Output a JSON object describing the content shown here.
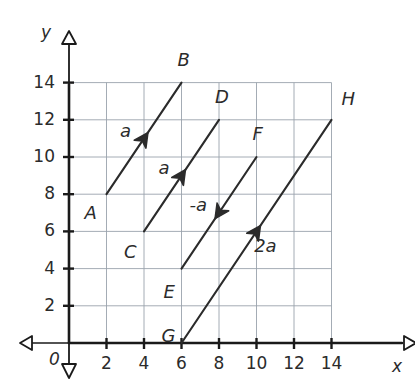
{
  "figure": {
    "axes": {
      "x": {
        "name": "x",
        "ticks": [
          2,
          4,
          6,
          8,
          10,
          12,
          14
        ],
        "min": 0,
        "max": 14,
        "origin_label": "0"
      },
      "y": {
        "name": "y",
        "ticks": [
          2,
          4,
          6,
          8,
          10,
          12,
          14
        ],
        "min": 0,
        "max": 14
      }
    },
    "colors": {
      "ink": "#2b2b2b",
      "grid": "#9aa3ad",
      "axis": "#1a1a1a",
      "vector": "#2b2b2b"
    }
  },
  "chart_data": {
    "type": "scatter",
    "title": "",
    "xlabel": "x",
    "ylabel": "y",
    "xlim": [
      0,
      14
    ],
    "ylim": [
      0,
      14
    ],
    "xticks": [
      2,
      4,
      6,
      8,
      10,
      12,
      14
    ],
    "yticks": [
      2,
      4,
      6,
      8,
      10,
      12,
      14
    ],
    "grid": true,
    "legend": "none",
    "vectors": [
      {
        "id": "AB",
        "tail_label": "A",
        "head_label": "B",
        "tail": [
          2,
          8
        ],
        "head": [
          6,
          14
        ],
        "components": [
          4,
          6
        ],
        "magnitude_label": "a",
        "label_pos": [
          3.2,
          11.4
        ]
      },
      {
        "id": "CD",
        "tail_label": "C",
        "head_label": "D",
        "tail": [
          4,
          6
        ],
        "head": [
          8,
          12
        ],
        "components": [
          4,
          6
        ],
        "magnitude_label": "a",
        "label_pos": [
          5.3,
          9.4
        ]
      },
      {
        "id": "FE",
        "tail_label": "F",
        "head_label": "E",
        "tail": [
          10,
          10
        ],
        "head": [
          6,
          4
        ],
        "components": [
          -4,
          -6
        ],
        "magnitude_label": "-a",
        "label_pos": [
          7.1,
          7.4
        ]
      },
      {
        "id": "GH",
        "tail_label": "G",
        "head_label": "H",
        "tail": [
          6,
          0
        ],
        "head": [
          14,
          12
        ],
        "components": [
          8,
          12
        ],
        "magnitude_label": "2a",
        "label_pos": [
          10.4,
          5.1
        ]
      }
    ],
    "midpoint_markers": [
      {
        "vector": "AB",
        "at": [
          4,
          11
        ]
      },
      {
        "vector": "CD",
        "at": [
          6,
          9
        ]
      },
      {
        "vector": "FE",
        "at": [
          8,
          7
        ]
      },
      {
        "vector": "GH",
        "at": [
          10,
          6
        ]
      }
    ]
  },
  "point_labels": [
    {
      "name": "A",
      "text": "A",
      "x": 2,
      "y": 8,
      "dx": -22,
      "dy": 20
    },
    {
      "name": "B",
      "text": "B",
      "x": 6,
      "y": 14,
      "dx": -4,
      "dy": -22
    },
    {
      "name": "C",
      "text": "C",
      "x": 4,
      "y": 6,
      "dx": -20,
      "dy": 22
    },
    {
      "name": "D",
      "text": "D",
      "x": 8,
      "y": 12,
      "dx": -4,
      "dy": -22
    },
    {
      "name": "E",
      "text": "E",
      "x": 6,
      "y": 4,
      "dx": -18,
      "dy": 24
    },
    {
      "name": "F",
      "text": "F",
      "x": 10,
      "y": 10,
      "dx": -4,
      "dy": -22
    },
    {
      "name": "G",
      "text": "G",
      "x": 6,
      "y": 0,
      "dx": -20,
      "dy": -6
    },
    {
      "name": "H",
      "text": "H",
      "x": 14,
      "y": 12,
      "dx": 10,
      "dy": -20
    }
  ],
  "vector_labels": [
    {
      "name": "a-ab",
      "text": "a",
      "x": 3.15,
      "y": 11.35
    },
    {
      "name": "a-cd",
      "text": "a",
      "x": 5.2,
      "y": 9.35
    },
    {
      "name": "neg-a",
      "text": "-a",
      "x": 6.85,
      "y": 7.35
    },
    {
      "name": "two-a",
      "text": "2a",
      "x": 10.3,
      "y": 5.15
    }
  ],
  "axis_tick_labels": {
    "x": [
      "2",
      "4",
      "6",
      "8",
      "10",
      "12",
      "14"
    ],
    "y": [
      "2",
      "4",
      "6",
      "8",
      "10",
      "12",
      "14"
    ],
    "origin": "0"
  },
  "axis_names": {
    "x": "x",
    "y": "y"
  }
}
